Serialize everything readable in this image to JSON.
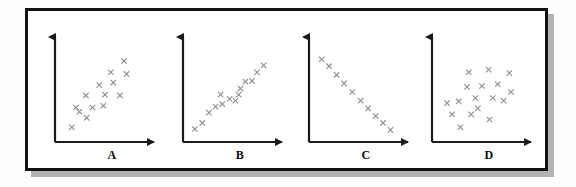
{
  "figure": {
    "title": "",
    "border_color": "#111111",
    "background": "#ffffff",
    "marker_color": "#8d8d8d",
    "axis_color": "#1a1a1a",
    "marker_symbol": "x"
  },
  "panels": [
    {
      "label": "A",
      "description": "positive correlation scatter"
    },
    {
      "label": "B",
      "description": "strong positive correlation scatter"
    },
    {
      "label": "C",
      "description": "strong negative correlation scatter"
    },
    {
      "label": "D",
      "description": "no correlation scatter"
    }
  ],
  "chart_data": [
    {
      "type": "scatter",
      "title": "A",
      "xlabel": "",
      "ylabel": "",
      "xlim": [
        0,
        100
      ],
      "ylim": [
        0,
        100
      ],
      "grid": false,
      "legend": "none",
      "annotations": [
        "A"
      ],
      "points": [
        {
          "x": 13,
          "y": 9
        },
        {
          "x": 31,
          "y": 20
        },
        {
          "x": 22,
          "y": 27
        },
        {
          "x": 18,
          "y": 32
        },
        {
          "x": 38,
          "y": 32
        },
        {
          "x": 51,
          "y": 34
        },
        {
          "x": 30,
          "y": 46
        },
        {
          "x": 53,
          "y": 47
        },
        {
          "x": 71,
          "y": 46
        },
        {
          "x": 46,
          "y": 58
        },
        {
          "x": 63,
          "y": 61
        },
        {
          "x": 60,
          "y": 73
        },
        {
          "x": 79,
          "y": 71
        },
        {
          "x": 76,
          "y": 86
        }
      ]
    },
    {
      "type": "scatter",
      "title": "B",
      "xlabel": "",
      "ylabel": "",
      "xlim": [
        0,
        100
      ],
      "ylim": [
        0,
        100
      ],
      "grid": false,
      "legend": "none",
      "annotations": [
        "B"
      ],
      "points": [
        {
          "x": 7,
          "y": 7
        },
        {
          "x": 16,
          "y": 14
        },
        {
          "x": 24,
          "y": 26
        },
        {
          "x": 32,
          "y": 33
        },
        {
          "x": 40,
          "y": 36
        },
        {
          "x": 38,
          "y": 47
        },
        {
          "x": 49,
          "y": 42
        },
        {
          "x": 56,
          "y": 40
        },
        {
          "x": 60,
          "y": 47
        },
        {
          "x": 62,
          "y": 54
        },
        {
          "x": 68,
          "y": 62
        },
        {
          "x": 76,
          "y": 63
        },
        {
          "x": 82,
          "y": 73
        },
        {
          "x": 90,
          "y": 81
        }
      ]
    },
    {
      "type": "scatter",
      "title": "C",
      "xlabel": "",
      "ylabel": "",
      "xlim": [
        0,
        100
      ],
      "ylim": [
        0,
        100
      ],
      "grid": false,
      "legend": "none",
      "annotations": [
        "C"
      ],
      "points": [
        {
          "x": 8,
          "y": 88
        },
        {
          "x": 17,
          "y": 80
        },
        {
          "x": 26,
          "y": 70
        },
        {
          "x": 35,
          "y": 60
        },
        {
          "x": 45,
          "y": 50
        },
        {
          "x": 55,
          "y": 40
        },
        {
          "x": 64,
          "y": 31
        },
        {
          "x": 73,
          "y": 22
        },
        {
          "x": 82,
          "y": 14
        },
        {
          "x": 91,
          "y": 6
        }
      ]
    },
    {
      "type": "scatter",
      "title": "D",
      "xlabel": "",
      "ylabel": "",
      "xlim": [
        0,
        100
      ],
      "ylim": [
        0,
        100
      ],
      "grid": false,
      "legend": "none",
      "annotations": [
        "D"
      ],
      "points": [
        {
          "x": 27,
          "y": 9
        },
        {
          "x": 17,
          "y": 24
        },
        {
          "x": 40,
          "y": 24
        },
        {
          "x": 62,
          "y": 18
        },
        {
          "x": 11,
          "y": 37
        },
        {
          "x": 25,
          "y": 39
        },
        {
          "x": 48,
          "y": 31
        },
        {
          "x": 45,
          "y": 43
        },
        {
          "x": 66,
          "y": 43
        },
        {
          "x": 79,
          "y": 40
        },
        {
          "x": 88,
          "y": 50
        },
        {
          "x": 35,
          "y": 56
        },
        {
          "x": 53,
          "y": 57
        },
        {
          "x": 72,
          "y": 59
        },
        {
          "x": 37,
          "y": 73
        },
        {
          "x": 61,
          "y": 76
        },
        {
          "x": 86,
          "y": 72
        }
      ]
    }
  ]
}
